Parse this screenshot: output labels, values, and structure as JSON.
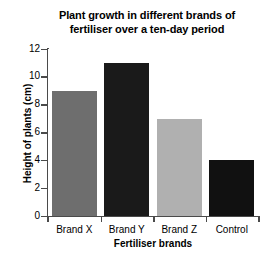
{
  "chart_data": {
    "type": "bar",
    "title": "Plant growth in different brands of fertiliser over a ten-day period",
    "title_lines": [
      "Plant growth in different brands of",
      "fertiliser over a ten-day period"
    ],
    "xlabel": "Fertiliser brands",
    "ylabel": "Height of plants (cm)",
    "categories": [
      "Brand X",
      "Brand Y",
      "Brand Z",
      "Control"
    ],
    "values": [
      9,
      11,
      7,
      4
    ],
    "bar_colors": [
      "#6e6e6e",
      "#1a1a1a",
      "#b0b0b0",
      "#111111"
    ],
    "ylim": [
      0,
      12
    ],
    "ytick_values": [
      0,
      2,
      4,
      6,
      8,
      10,
      12
    ],
    "ytick_labels": [
      "0",
      "2",
      "4",
      "6",
      "8",
      "10",
      "12"
    ],
    "grid": false,
    "legend": false,
    "axis_color": "#4a4a4a",
    "background_color": "#ffffff"
  }
}
